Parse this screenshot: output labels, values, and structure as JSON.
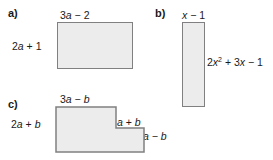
{
  "figure": {
    "background_color": "#ffffff",
    "shape_fill_color": "#ececec",
    "shape_border_color": "#808080",
    "text_color": "#1a1a1a"
  },
  "parts": {
    "a": {
      "letter": "a)",
      "shape_type": "rectangle",
      "top_label": "3a − 2",
      "left_label": "2a + 1"
    },
    "b": {
      "letter": "b)",
      "shape_type": "rectangle",
      "top_label": "x − 1",
      "right_label": "2x² + 3x − 1"
    },
    "c": {
      "letter": "c)",
      "shape_type": "l-shape",
      "top_label": "3a − b",
      "left_label": "2a + b",
      "inner_right_label": "a + b",
      "outer_right_label": "a − b"
    }
  }
}
